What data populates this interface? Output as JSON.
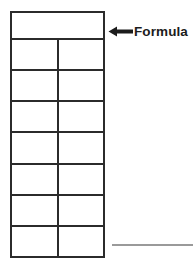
{
  "diagram": {
    "annotation": {
      "label": "Formula",
      "arrow_icon": "arrow-left-icon",
      "arrow_direction": "left",
      "points_to": "header-row",
      "color": "#1c1c1c"
    },
    "bottom_rule": {
      "name": "horizontal-rule",
      "color": "#9a9a9a"
    },
    "colors": {
      "table_border": "#2b2b2b",
      "cell_fill": "#ffffff",
      "rule": "#9a9a9a",
      "text": "#1c1c1c",
      "background": "#ffffff"
    },
    "table": {
      "columns": 2,
      "rows": 8,
      "header_merged": true,
      "header_row": {
        "name": "formula-header-row",
        "colspan": 2,
        "value": ""
      },
      "data_rows": [
        {
          "left": "",
          "right": ""
        },
        {
          "left": "",
          "right": ""
        },
        {
          "left": "",
          "right": ""
        },
        {
          "left": "",
          "right": ""
        },
        {
          "left": "",
          "right": ""
        },
        {
          "left": "",
          "right": ""
        },
        {
          "left": "",
          "right": ""
        }
      ]
    }
  }
}
